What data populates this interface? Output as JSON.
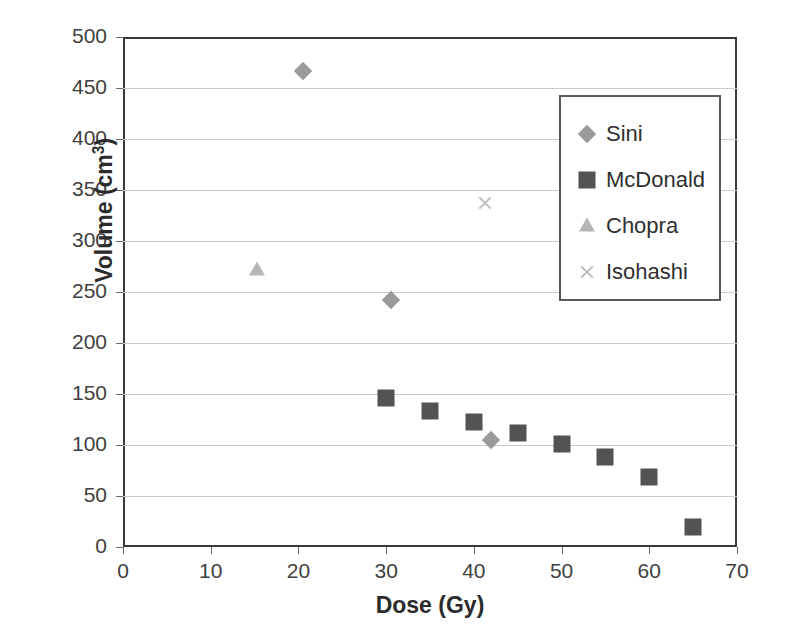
{
  "chart_data": {
    "type": "scatter",
    "title": "",
    "xlabel": "Dose (Gy)",
    "ylabel": "Volume (cm3)",
    "ylabel_base": "Volume (cm",
    "ylabel_sup": "3",
    "ylabel_close": ")",
    "xlim": [
      0,
      70
    ],
    "ylim": [
      0,
      500
    ],
    "xticks": [
      0,
      10,
      20,
      30,
      40,
      50,
      60,
      70
    ],
    "yticks": [
      0,
      50,
      100,
      150,
      200,
      250,
      300,
      350,
      400,
      450,
      500
    ],
    "grid": "horizontal",
    "legend_position": "upper-right-inside",
    "series": [
      {
        "name": "Sini",
        "marker": "diamond",
        "color": "#9a9a9a",
        "points": [
          {
            "x": 20.5,
            "y": 467
          },
          {
            "x": 30.5,
            "y": 242
          },
          {
            "x": 42.0,
            "y": 105
          }
        ]
      },
      {
        "name": "McDonald",
        "marker": "square",
        "color": "#535353",
        "points": [
          {
            "x": 30,
            "y": 146
          },
          {
            "x": 35,
            "y": 133
          },
          {
            "x": 40,
            "y": 123
          },
          {
            "x": 45,
            "y": 112
          },
          {
            "x": 50,
            "y": 101
          },
          {
            "x": 55,
            "y": 88
          },
          {
            "x": 60,
            "y": 69
          },
          {
            "x": 65,
            "y": 20
          }
        ]
      },
      {
        "name": "Chopra",
        "marker": "triangle",
        "color": "#b6b6b6",
        "points": [
          {
            "x": 15.3,
            "y": 272
          }
        ]
      },
      {
        "name": "Isohashi",
        "marker": "cross",
        "color": "#bdbdbd",
        "points": [
          {
            "x": 41.3,
            "y": 337
          }
        ]
      }
    ]
  }
}
